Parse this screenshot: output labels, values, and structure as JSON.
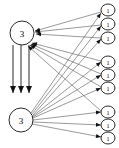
{
  "figure": {
    "width": 119,
    "height": 148,
    "background_color": "#ffffff",
    "edge_color": "#555555",
    "node_stroke_color": "#2b2b2b",
    "node_fill_color": "#ffffff",
    "arrow_color": "#111111"
  },
  "chart_data": {
    "type": "diagram",
    "title": "",
    "nodes": [
      {
        "id": "L1",
        "label": "3",
        "cx": 22,
        "cy": 33,
        "rx": 12,
        "ry": 12,
        "group": "left",
        "size": "big"
      },
      {
        "id": "L2",
        "label": "3",
        "cx": 21,
        "cy": 120,
        "rx": 12,
        "ry": 12,
        "group": "left",
        "size": "big"
      },
      {
        "id": "R1",
        "label": "1",
        "cx": 108,
        "cy": 10,
        "rx": 7,
        "ry": 6,
        "group": "right",
        "size": "small"
      },
      {
        "id": "R2",
        "label": "1",
        "cx": 108,
        "cy": 24,
        "rx": 7,
        "ry": 6,
        "group": "right",
        "size": "small"
      },
      {
        "id": "R3",
        "label": "1",
        "cx": 108,
        "cy": 38,
        "rx": 7,
        "ry": 6,
        "group": "right",
        "size": "small"
      },
      {
        "id": "R4",
        "label": "1",
        "cx": 108,
        "cy": 62,
        "rx": 7,
        "ry": 6,
        "group": "right",
        "size": "small"
      },
      {
        "id": "R5",
        "label": "1",
        "cx": 108,
        "cy": 75,
        "rx": 7,
        "ry": 6,
        "group": "right",
        "size": "small"
      },
      {
        "id": "R6",
        "label": "1",
        "cx": 108,
        "cy": 88,
        "rx": 7,
        "ry": 6,
        "group": "right",
        "size": "small"
      },
      {
        "id": "R7",
        "label": "1",
        "cx": 108,
        "cy": 112,
        "rx": 7,
        "ry": 6,
        "group": "right",
        "size": "small"
      },
      {
        "id": "R8",
        "label": "1",
        "cx": 108,
        "cy": 125,
        "rx": 7,
        "ry": 6,
        "group": "right",
        "size": "small"
      },
      {
        "id": "R9",
        "label": "1",
        "cx": 108,
        "cy": 138,
        "rx": 7,
        "ry": 6,
        "group": "right",
        "size": "small"
      }
    ],
    "edges": [
      {
        "from": "R1",
        "to": "L1",
        "x1": 101,
        "y1": 12,
        "x2": 35,
        "y2": 31,
        "style": "thin"
      },
      {
        "from": "R2",
        "to": "L1",
        "x1": 101,
        "y1": 25,
        "x2": 35,
        "y2": 32,
        "style": "thin"
      },
      {
        "from": "R3",
        "to": "L1",
        "x1": 101,
        "y1": 38,
        "x2": 36,
        "y2": 34,
        "style": "thin"
      },
      {
        "from": "R4",
        "to": "L1",
        "x1": 101,
        "y1": 61,
        "x2": 32,
        "y2": 43,
        "style": "thin"
      },
      {
        "from": "R5",
        "to": "L1",
        "x1": 101,
        "y1": 74,
        "x2": 31,
        "y2": 44,
        "style": "thin"
      },
      {
        "from": "R6",
        "to": "L1",
        "x1": 101,
        "y1": 87,
        "x2": 30,
        "y2": 45,
        "style": "thin"
      },
      {
        "from": "R7",
        "to": "L1",
        "x1": 101,
        "y1": 111,
        "x2": 28,
        "y2": 46,
        "style": "thin"
      },
      {
        "from": "L2",
        "to": "R1",
        "x1": 31,
        "y1": 113,
        "x2": 101,
        "y2": 13,
        "style": "thin"
      },
      {
        "from": "L2",
        "to": "R2",
        "x1": 32,
        "y1": 114,
        "x2": 101,
        "y2": 26,
        "style": "thin"
      },
      {
        "from": "L2",
        "to": "R3",
        "x1": 33,
        "y1": 115,
        "x2": 101,
        "y2": 39,
        "style": "thin"
      },
      {
        "from": "L2",
        "to": "R4",
        "x1": 33,
        "y1": 116,
        "x2": 101,
        "y2": 62,
        "style": "thin"
      },
      {
        "from": "L2",
        "to": "R5",
        "x1": 33,
        "y1": 117,
        "x2": 101,
        "y2": 75,
        "style": "thin"
      },
      {
        "from": "L2",
        "to": "R6",
        "x1": 33,
        "y1": 118,
        "x2": 101,
        "y2": 88,
        "style": "thin"
      },
      {
        "from": "L2",
        "to": "R7",
        "x1": 33,
        "y1": 120,
        "x2": 101,
        "y2": 112,
        "style": "thin"
      },
      {
        "from": "L2",
        "to": "R8",
        "x1": 33,
        "y1": 122,
        "x2": 101,
        "y2": 125,
        "style": "thin"
      },
      {
        "from": "L2",
        "to": "R9",
        "x1": 32,
        "y1": 124,
        "x2": 101,
        "y2": 137,
        "style": "thin"
      },
      {
        "from": "L1",
        "to": "down-a",
        "x1": 13,
        "y1": 45,
        "x2": 13,
        "y2": 93,
        "style": "thick"
      },
      {
        "from": "L1",
        "to": "down-b",
        "x1": 21,
        "y1": 45,
        "x2": 21,
        "y2": 93,
        "style": "thick"
      },
      {
        "from": "L1",
        "to": "down-c",
        "x1": 29,
        "y1": 45,
        "x2": 29,
        "y2": 93,
        "style": "thick"
      }
    ],
    "node_count": 11,
    "edge_count": 19,
    "left_label": "3",
    "right_label": "1"
  }
}
